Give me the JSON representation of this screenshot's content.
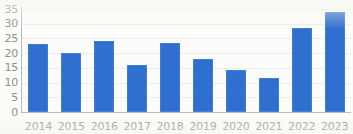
{
  "chart_data": {
    "type": "bar",
    "title": "",
    "subtitle": "",
    "xlabel": "",
    "ylabel": "",
    "categories": [
      "2014",
      "2015",
      "2016",
      "2017",
      "2018",
      "2019",
      "2020",
      "2021",
      "2022",
      "2023"
    ],
    "values": [
      23,
      20,
      24,
      16,
      23.3,
      18,
      14.3,
      11.4,
      28.7,
      34
    ],
    "ylim": [
      0,
      35
    ],
    "y_ticks": [
      0,
      5,
      10,
      15,
      20,
      25,
      30,
      35
    ],
    "y_tick_labels": [
      "0",
      "5",
      "10",
      "15",
      "20",
      "25",
      "30",
      "35"
    ],
    "grid": true,
    "grid_axis": "y",
    "legend": false,
    "legend_position": "none",
    "series": [
      {
        "name": "",
        "values": [
          23,
          20,
          24,
          16,
          23.3,
          18,
          14.3,
          11.4,
          28.7,
          34
        ]
      }
    ],
    "annotations": [],
    "colors": {
      "bar": "#2f6fd0",
      "axis": "#b9bab7",
      "gridline": "#ededea",
      "tick_label": "#8b8c8a",
      "background": "#fcfcfa"
    }
  }
}
